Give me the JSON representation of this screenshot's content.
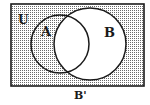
{
  "diagram": {
    "type": "venn",
    "universe_label": "U",
    "sets": [
      {
        "label": "A"
      },
      {
        "label": "B"
      }
    ],
    "shaded_region": "B'",
    "caption": "B'",
    "colors": {
      "stroke": "#1a1a1a",
      "shade_dot": "#555555",
      "background": "#ffffff"
    }
  }
}
